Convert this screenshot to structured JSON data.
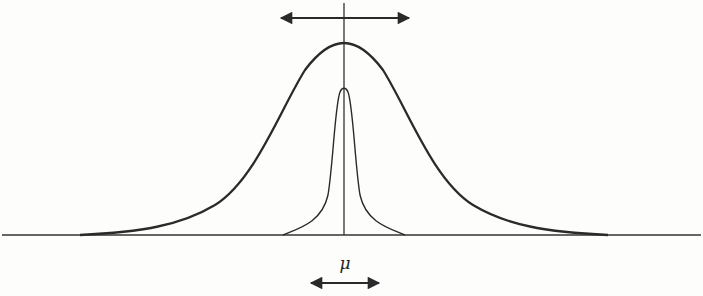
{
  "figure": {
    "stroke_color": "#2a2a2a",
    "background": "#fdfdfb",
    "mean_label": "μ",
    "curves": [
      {
        "name": "wide-distribution",
        "peak_height_px": 192,
        "half_width_px": 265
      },
      {
        "name": "narrow-distribution",
        "peak_height_px": 148,
        "half_width_px": 62
      }
    ],
    "annotations": {
      "top_arrow": "double-headed horizontal arrow above the peak",
      "bottom_arrow": "double-headed horizontal arrow below the mean label"
    }
  }
}
